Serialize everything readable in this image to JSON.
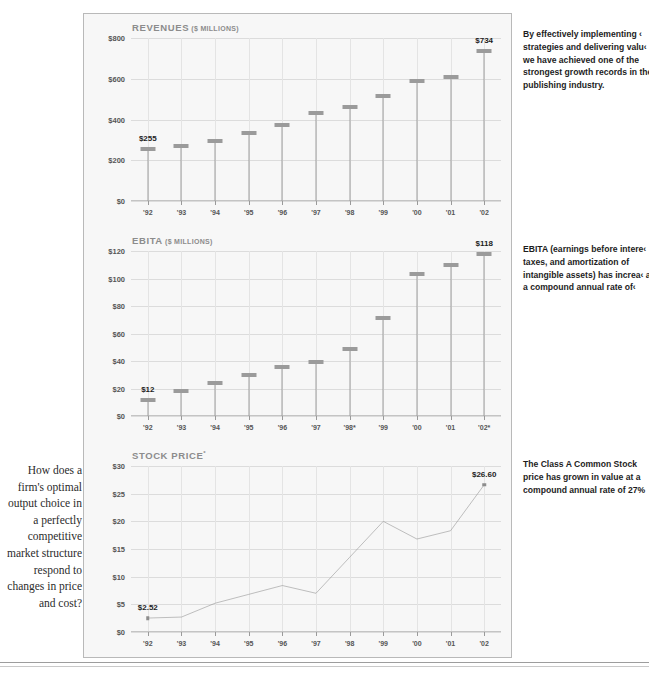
{
  "side_question": "How does a firm's optimal output choice in a perfectly competitive market structure respond to changes in price and cost?",
  "notes": [
    "By effectively implementing ‹ strategies and delivering valu‹ we have achieved one of the strongest growth records in the publishing industry.",
    "EBITA (earnings before intere‹ taxes, and amortization of intangible assets) has increa‹ at a compound annual rate of‹",
    "The Class A Common Stock price has grown in value at a compound annual rate of 27%"
  ],
  "chart_data": [
    {
      "type": "bar",
      "title": "REVENUES",
      "unit": "($ MILLIONS)",
      "title_sup": "",
      "categories": [
        "'92",
        "'93",
        "'94",
        "'95",
        "'96",
        "'97",
        "'98",
        "'99",
        "'00",
        "'01",
        "'02"
      ],
      "values": [
        255,
        272,
        294,
        336,
        371,
        432,
        461,
        513,
        590,
        609,
        734
      ],
      "point_labels": {
        "0": "$255",
        "10": "$734"
      },
      "ylabel": "",
      "xlabel": "",
      "ylim": [
        0,
        800
      ],
      "yticks": [
        0,
        200,
        400,
        600,
        800
      ],
      "ytick_labels": [
        "$0",
        "$200",
        "$400",
        "$600",
        "$800"
      ],
      "grid": true
    },
    {
      "type": "bar",
      "title": "EBITA",
      "unit": "($ MILLIONS)",
      "title_sup": "",
      "categories": [
        "'92",
        "'93",
        "'94",
        "'95",
        "'96",
        "'97",
        "'98*",
        "'99",
        "'00",
        "'01",
        "'02*"
      ],
      "values": [
        12,
        18,
        24,
        30,
        36,
        39,
        49,
        71,
        103,
        110,
        118
      ],
      "point_labels": {
        "0": "$12",
        "10": "$118"
      },
      "ylabel": "",
      "xlabel": "",
      "ylim": [
        0,
        120
      ],
      "yticks": [
        0,
        20,
        40,
        60,
        80,
        100,
        120
      ],
      "ytick_labels": [
        "$0",
        "$20",
        "$40",
        "$60",
        "$80",
        "$100",
        "$120"
      ],
      "grid": true
    },
    {
      "type": "line",
      "title": "STOCK PRICE",
      "unit": "",
      "title_sup": "*",
      "categories": [
        "'92",
        "'93",
        "'94",
        "'95",
        "'96",
        "'97",
        "'98",
        "'99",
        "'00",
        "'01",
        "'02"
      ],
      "values": [
        2.52,
        2.7,
        5.2,
        6.8,
        8.4,
        7.0,
        13.5,
        20.0,
        16.8,
        18.3,
        26.6
      ],
      "point_labels": {
        "0": "$2.52",
        "10": "$26.60"
      },
      "ylabel": "",
      "xlabel": "",
      "ylim": [
        0,
        30
      ],
      "yticks": [
        0,
        5,
        10,
        15,
        20,
        25,
        30
      ],
      "ytick_labels": [
        "$0",
        "$5",
        "$10",
        "$15",
        "$20",
        "$25",
        "$30"
      ],
      "grid": true
    }
  ]
}
